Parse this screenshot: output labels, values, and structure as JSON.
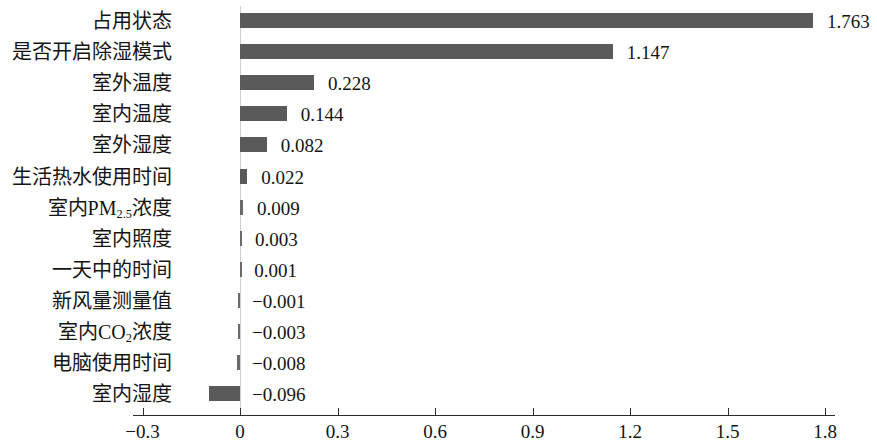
{
  "chart_data": {
    "type": "bar",
    "orientation": "horizontal",
    "title": "",
    "xlabel": "",
    "ylabel": "",
    "xlim": [
      -0.3,
      1.8
    ],
    "grid": false,
    "legend": null,
    "bar_color": "#5a5a5a",
    "axis_color": "#2a2a2a",
    "zero_line_color": "#cfcfcf",
    "xticks": [
      -0.3,
      0,
      0.3,
      0.6,
      0.9,
      1.2,
      1.5,
      1.8
    ],
    "xtick_labels": [
      "−0.3",
      "0",
      "0.3",
      "0.6",
      "0.9",
      "1.2",
      "1.5",
      "1.8"
    ],
    "categories": [
      "占用状态",
      "是否开启除湿模式",
      "室外温度",
      "室内温度",
      "室外湿度",
      "生活热水使用时间",
      "室内PM2.5浓度",
      "室内照度",
      "一天中的时间",
      "新风量测量值",
      "室内CO2浓度",
      "电脑使用时间",
      "室内湿度"
    ],
    "categories_html": [
      "占用状态",
      "是否开启除湿模式",
      "室外温度",
      "室内温度",
      "室外湿度",
      "生活热水使用时间",
      "室内PM<sub>2.5</sub>浓度",
      "室内照度",
      "一天中的时间",
      "新风量测量值",
      "室内CO<sub>2</sub>浓度",
      "电脑使用时间",
      "室内湿度"
    ],
    "values": [
      1.763,
      1.147,
      0.228,
      0.144,
      0.082,
      0.022,
      0.009,
      0.003,
      0.001,
      -0.001,
      -0.003,
      -0.008,
      -0.096
    ],
    "value_labels": [
      "1.763",
      "1.147",
      "0.228",
      "0.144",
      "0.082",
      "0.022",
      "0.009",
      "0.003",
      "0.001",
      "−0.001",
      "−0.003",
      "−0.008",
      "−0.096"
    ]
  }
}
